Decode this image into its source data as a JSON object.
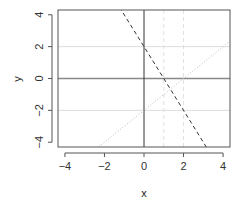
{
  "chart_data": {
    "type": "line",
    "title": "",
    "xlabel": "x",
    "ylabel": "y",
    "xlim": [
      -4.35,
      4.35
    ],
    "ylim": [
      -4.3,
      4.3
    ],
    "x_ticks": [
      -4,
      -2,
      0,
      2,
      4
    ],
    "y_ticks": [
      -4,
      -2,
      0,
      2,
      4
    ],
    "x_tick_labels": [
      "−4",
      "−2",
      "0",
      "2",
      "4"
    ],
    "y_tick_labels": [
      "−4",
      "−2",
      "0",
      "2",
      "4"
    ],
    "grid": false,
    "legend": null,
    "series": [
      {
        "name": "y = -2x + 2",
        "kind": "abline",
        "intercept": 2,
        "slope": -2,
        "style": "dashed",
        "color": "#333333"
      },
      {
        "name": "y = x - 2",
        "kind": "abline",
        "intercept": -2,
        "slope": 1,
        "style": "dotted",
        "color": "#bbbbbb"
      }
    ],
    "reference_lines": [
      {
        "orientation": "vertical",
        "value": 0,
        "style": "solid",
        "color": "#333333"
      },
      {
        "orientation": "horizontal",
        "value": 0,
        "style": "solid",
        "color": "#888888"
      },
      {
        "orientation": "horizontal",
        "value": 2,
        "style": "solid",
        "color": "#dddddd"
      },
      {
        "orientation": "horizontal",
        "value": -2,
        "style": "solid",
        "color": "#dddddd"
      },
      {
        "orientation": "vertical",
        "value": 1,
        "style": "dashed",
        "color": "#e0e0e0"
      },
      {
        "orientation": "vertical",
        "value": 2,
        "style": "dashed",
        "color": "#e0e0e0"
      }
    ]
  }
}
